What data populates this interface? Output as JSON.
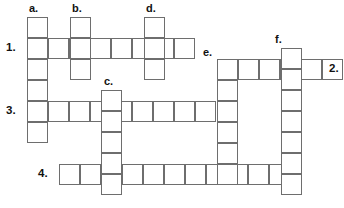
{
  "puzzle": {
    "type": "crossword-grid",
    "cell_size": 21,
    "grid_color": "#6e6e6e",
    "background": "#ffffff",
    "label_color": "#111111",
    "across_entries": [
      {
        "number": "1.",
        "cells": 8,
        "x": 27,
        "y": 38,
        "label_x": 6,
        "label_y": 42
      },
      {
        "number": "3.",
        "cells": 9,
        "x": 27,
        "y": 101,
        "label_x": 6,
        "label_y": 105
      },
      {
        "number": "4.",
        "cells": 11,
        "x": 59,
        "y": 164,
        "label_x": 38,
        "label_y": 168
      },
      {
        "number": "2.",
        "cells": 5,
        "x": 238,
        "y": 59,
        "label_x": 329,
        "label_y": 63
      }
    ],
    "down_entries": [
      {
        "letter": "a.",
        "cells": 6,
        "x": 27,
        "y": 17,
        "label_x": 29,
        "label_y": 3
      },
      {
        "letter": "b.",
        "cells": 3,
        "x": 70,
        "y": 17,
        "label_x": 72,
        "label_y": 3
      },
      {
        "letter": "c.",
        "cells": 5,
        "x": 101,
        "y": 90,
        "label_x": 104,
        "label_y": 76
      },
      {
        "letter": "d.",
        "cells": 3,
        "x": 144,
        "y": 17,
        "label_x": 146,
        "label_y": 3
      },
      {
        "letter": "e.",
        "cells": 6,
        "x": 217,
        "y": 59,
        "label_x": 203,
        "label_y": 47
      },
      {
        "letter": "f.",
        "cells": 7,
        "x": 281,
        "y": 48,
        "label_x": 275,
        "label_y": 34
      }
    ]
  }
}
